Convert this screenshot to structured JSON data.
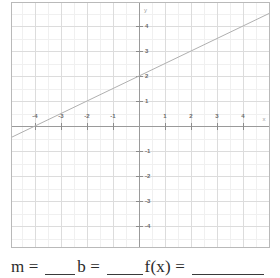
{
  "worksheet": {
    "prompt": {
      "m_label": "m = ",
      "b_label": "b = ",
      "f_label": "f(x) = ",
      "m_value": "",
      "b_value": "",
      "f_value": ""
    }
  },
  "graph": {
    "x_axis_name": "x",
    "y_axis_name": "y",
    "x_tick_labels": [
      "-4",
      "-3",
      "-2",
      "-1",
      "1",
      "2",
      "3",
      "4"
    ],
    "y_tick_labels": [
      "4",
      "3",
      "2",
      "1",
      "-1",
      "-2",
      "-3",
      "-4"
    ],
    "line_color": "#b0b0b0",
    "axis_color": "#9a9a9a",
    "grid_color": "#dcdcdc",
    "grid_minor_color": "#f0f0f0",
    "border_color": "#b9b9b9"
  },
  "chart_data": {
    "type": "line",
    "title": "",
    "xlabel": "x",
    "ylabel": "y",
    "xlim": [
      -4.9,
      5.1
    ],
    "ylim": [
      -4.9,
      4.9
    ],
    "xticks": [
      -4,
      -3,
      -2,
      -1,
      1,
      2,
      3,
      4
    ],
    "yticks": [
      4,
      3,
      2,
      1,
      -1,
      -2,
      -3,
      -4
    ],
    "grid": true,
    "legend": null,
    "series": [
      {
        "name": "f(x)",
        "slope": 0.5,
        "intercept": 2,
        "x_intercept": -4,
        "y_intercept": 2,
        "equation": "y = 0.5x + 2",
        "points": [
          {
            "x": -4.9,
            "y": -0.45
          },
          {
            "x": -4,
            "y": 0
          },
          {
            "x": -2,
            "y": 1
          },
          {
            "x": 0,
            "y": 2
          },
          {
            "x": 2,
            "y": 3
          },
          {
            "x": 4,
            "y": 4
          },
          {
            "x": 5.1,
            "y": 4.55
          }
        ]
      }
    ]
  }
}
